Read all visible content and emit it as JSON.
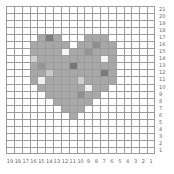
{
  "grid": {
    "cols": 19,
    "rows": 21,
    "column_labels": [
      "19",
      "18",
      "17",
      "16",
      "15",
      "14",
      "13",
      "12",
      "11",
      "10",
      "9",
      "8",
      "7",
      "6",
      "5",
      "4",
      "3",
      "2",
      "1"
    ],
    "row_labels": [
      "21",
      "20",
      "19",
      "18",
      "17",
      "16",
      "15",
      "14",
      "13",
      "12",
      "11",
      "10",
      "9",
      "8",
      "7",
      "6",
      "5",
      "4",
      "3",
      "2",
      "1"
    ],
    "line_color": "#9a9a9a",
    "background": "#ffffff"
  },
  "heart": {
    "base_color": "#a8a8a8",
    "rows": [
      {
        "row": 4,
        "spans": [
          [
            4,
            6
          ],
          [
            10,
            12
          ]
        ]
      },
      {
        "row": 5,
        "spans": [
          [
            3,
            7
          ],
          [
            9,
            13
          ]
        ]
      },
      {
        "row": 6,
        "spans": [
          [
            3,
            13
          ]
        ]
      },
      {
        "row": 7,
        "spans": [
          [
            3,
            13
          ]
        ]
      },
      {
        "row": 8,
        "spans": [
          [
            3,
            13
          ]
        ]
      },
      {
        "row": 9,
        "spans": [
          [
            3,
            13
          ]
        ]
      },
      {
        "row": 10,
        "spans": [
          [
            3,
            13
          ]
        ]
      },
      {
        "row": 11,
        "spans": [
          [
            4,
            12
          ]
        ]
      },
      {
        "row": 12,
        "spans": [
          [
            5,
            11
          ]
        ]
      },
      {
        "row": 13,
        "spans": [
          [
            6,
            10
          ]
        ]
      },
      {
        "row": 14,
        "spans": [
          [
            7,
            9
          ]
        ]
      },
      {
        "row": 15,
        "spans": [
          [
            8,
            8
          ]
        ]
      }
    ],
    "accents": [
      {
        "row": 4,
        "col": 5,
        "color": "#7d7d7d"
      },
      {
        "row": 5,
        "col": 11,
        "color": "#8e8e8e"
      },
      {
        "row": 6,
        "col": 7,
        "color": "#f4f4f4"
      },
      {
        "row": 7,
        "col": 3,
        "color": "#cfcfcf"
      },
      {
        "row": 7,
        "col": 12,
        "color": "#f4f4f4"
      },
      {
        "row": 8,
        "col": 8,
        "color": "#767676"
      },
      {
        "row": 9,
        "col": 5,
        "color": "#c9c9c9"
      },
      {
        "row": 9,
        "col": 12,
        "color": "#7a7a7a"
      },
      {
        "row": 10,
        "col": 4,
        "color": "#f0f0f0"
      },
      {
        "row": 10,
        "col": 9,
        "color": "#cfcfcf"
      },
      {
        "row": 11,
        "col": 10,
        "color": "#f0f0f0"
      },
      {
        "row": 12,
        "col": 9,
        "color": "#8e8e8e"
      },
      {
        "row": 6,
        "col": 10,
        "color": "#959595"
      },
      {
        "row": 8,
        "col": 4,
        "color": "#959595"
      }
    ]
  }
}
